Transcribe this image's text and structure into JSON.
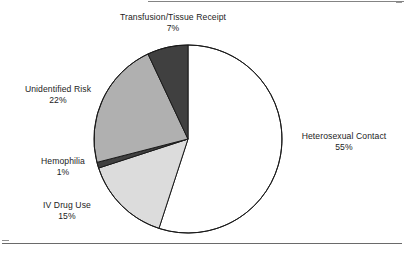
{
  "figure": {
    "background_color": "#ffffff",
    "frame": {
      "has_top_rule": true,
      "has_bottom_rule": true,
      "rule_color": "#6a6a6a"
    }
  },
  "chart_data": {
    "type": "pie",
    "title": "",
    "subtitle": "",
    "xlabel": "",
    "ylabel": "",
    "grid": false,
    "legend_position": "none",
    "labels_outside": true,
    "start_angle_deg": 0,
    "direction": "clockwise",
    "center": {
      "x": 188,
      "y": 139
    },
    "radius": 94,
    "total_percent": 100,
    "categories": [
      "Heterosexual Contact",
      "IV Drug Use",
      "Hemophilia",
      "Unidentified Risk",
      "Transfusion/Tissue Receipt"
    ],
    "values": [
      55,
      15,
      1,
      22,
      7
    ],
    "value_suffix": "%",
    "slices": [
      {
        "name": "Heterosexual Contact",
        "value": 55,
        "value_label": "55%",
        "fill": "#ffffff",
        "stroke": "#1a1a1a",
        "label_position": "right"
      },
      {
        "name": "IV Drug Use",
        "value": 15,
        "value_label": "15%",
        "fill": "#dcdcdc",
        "stroke": "#1a1a1a",
        "label_position": "lower-left"
      },
      {
        "name": "Hemophilia",
        "value": 1,
        "value_label": "1%",
        "fill": "#404040",
        "stroke": "#1a1a1a",
        "label_position": "left"
      },
      {
        "name": "Unidentified Risk",
        "value": 22,
        "value_label": "22%",
        "fill": "#b0b0b0",
        "stroke": "#1a1a1a",
        "label_position": "upper-left"
      },
      {
        "name": "Transfusion/Tissue Receipt",
        "value": 7,
        "value_label": "7%",
        "fill": "#404040",
        "stroke": "#1a1a1a",
        "label_position": "top"
      }
    ]
  },
  "labels": {
    "transfusion": {
      "name": "Transfusion/Tissue Receipt",
      "pct": "7%"
    },
    "unidentified": {
      "name": "Unidentified Risk",
      "pct": "22%"
    },
    "hemophilia": {
      "name": "Hemophilia",
      "pct": "1%"
    },
    "ivdrug": {
      "name": "IV Drug Use",
      "pct": "15%"
    },
    "heterosexual": {
      "name": "Heterosexual Contact",
      "pct": "55%"
    }
  }
}
